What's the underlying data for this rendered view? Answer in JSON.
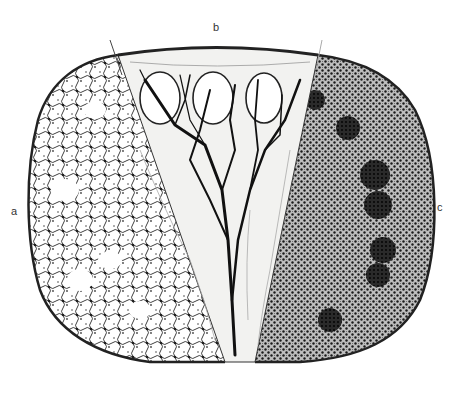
{
  "figure": {
    "labels": [
      {
        "id": "a",
        "text": "a",
        "region": "left sector (reticular network)"
      },
      {
        "id": "b",
        "text": "b",
        "region": "central wedge (branching vessels / sinuses)"
      },
      {
        "id": "c",
        "text": "c",
        "region": "right sector (dense cellular with follicles)"
      }
    ],
    "colors": {
      "ink": "#1a1a1a",
      "wedge_fill": "#f2f2f0",
      "background": "#ffffff",
      "dense_fill": "#3a3a3a"
    }
  }
}
